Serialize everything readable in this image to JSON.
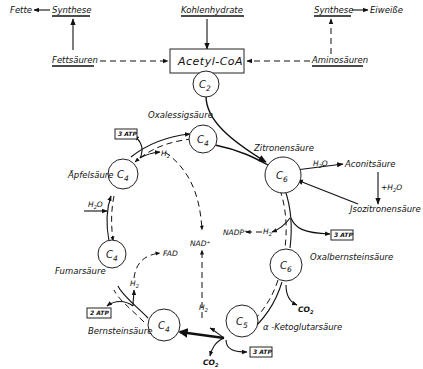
{
  "diagram": {
    "top": {
      "fette": "Fette",
      "synthese_left": "Synthese",
      "kohlenhydrate": "Kohlenhydrate",
      "synthese_right": "Synthese",
      "eiweisse": "Eiweiße",
      "fettsaeuren": "Fettsäuren",
      "aminosaeuren": "Aminosäuren",
      "acetyl_coa": "Acetyl-CoA"
    },
    "nodes": {
      "c2": "C",
      "c2_sub": "2",
      "oxalessig": "C",
      "oxalessig_sub": "4",
      "zitronen": "C",
      "zitronen_sub": "6",
      "apfel": "C",
      "apfel_sub": "4",
      "fumar": "C",
      "fumar_sub": "4",
      "oxalbernstein": "C",
      "oxalbernstein_sub": "6",
      "bernstein": "C",
      "bernstein_sub": "4",
      "ketoglutar": "C",
      "ketoglutar_sub": "5"
    },
    "labels": {
      "oxalessigsaeure": "Oxalessigsäure",
      "zitronensaeure": "Zitronensäure",
      "aconitsaeure": "Aconitsäure",
      "isozitronensaeure": "Jsozitronensäure",
      "plus_h2o": "+H",
      "h2o_aconit": "H",
      "apfelsaeure": "Äpfelsäure",
      "fumarsaeure": "Fumarsäure",
      "bernsteinsaeure": "Bernsteinsäure",
      "oxalbernsteinsaeure": "Oxalbernsteinsäure",
      "ketoglutarsaeure": "α -Ketoglutarsäure",
      "nad": "NAD⁺",
      "nadp": "NADP⁺",
      "fad": "FAD",
      "h2o_left": "H",
      "h2": "H",
      "co2": "CO",
      "sub2": "2",
      "o": "O"
    },
    "atp_boxes": {
      "atp_top_left": "3 ATP",
      "atp_right": "3 ATP",
      "atp_bottom_left": "2 ATP",
      "atp_bottom": "3 ATP"
    }
  }
}
